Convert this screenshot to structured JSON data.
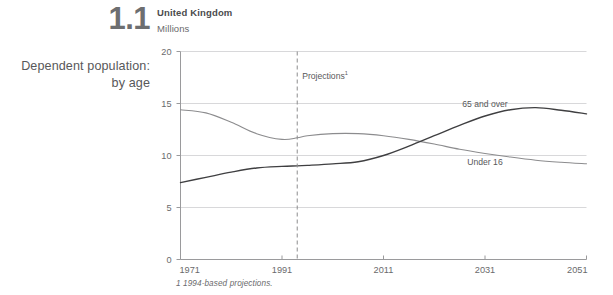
{
  "figure": {
    "number": "1.1",
    "side_title_line1": "Dependent population:",
    "side_title_line2": "by age",
    "country": "United Kingdom",
    "units": "Millions",
    "footnote": "1  1994-based projections."
  },
  "annotations": {
    "projections_label": "Projections",
    "projections_superscript": "1",
    "projections_year": 1994
  },
  "colors": {
    "under16_line": "#8c8c8e",
    "over65_line": "#3f3f41",
    "gridline": "#d8d8da",
    "axis": "#9a9a9c",
    "text": "#58585a",
    "background": "#ffffff"
  },
  "chart_data": {
    "type": "line",
    "title": "Dependent population: by age",
    "subtitle": "United Kingdom",
    "xlabel": "",
    "ylabel": "Millions",
    "xlim": [
      1971,
      2051
    ],
    "ylim": [
      0,
      20
    ],
    "xticks": [
      1971,
      1991,
      2011,
      2031,
      2051
    ],
    "xtick_labels": [
      "1971",
      "1991",
      "2011",
      "2031",
      "2051"
    ],
    "yticks": [
      0,
      5,
      10,
      15,
      20
    ],
    "ytick_labels": [
      "0",
      "5",
      "10",
      "15",
      "20"
    ],
    "grid": true,
    "legend_position": "inline-right",
    "x": [
      1971,
      1976,
      1981,
      1986,
      1991,
      1994,
      1996,
      2001,
      2006,
      2011,
      2016,
      2021,
      2026,
      2031,
      2036,
      2041,
      2046,
      2051
    ],
    "series": [
      {
        "name": "Under 16",
        "label": "Under 16",
        "color": "#8c8c8e",
        "values": [
          14.4,
          14.1,
          13.2,
          12.1,
          11.55,
          11.7,
          11.9,
          12.1,
          12.1,
          11.9,
          11.55,
          11.1,
          10.6,
          10.2,
          9.85,
          9.55,
          9.35,
          9.2
        ]
      },
      {
        "name": "65 and over",
        "label": "65 and over",
        "color": "#3f3f41",
        "values": [
          7.4,
          7.9,
          8.4,
          8.8,
          8.95,
          9.0,
          9.05,
          9.2,
          9.4,
          10.0,
          10.9,
          11.9,
          12.9,
          13.8,
          14.4,
          14.6,
          14.35,
          14.0
        ]
      }
    ]
  }
}
